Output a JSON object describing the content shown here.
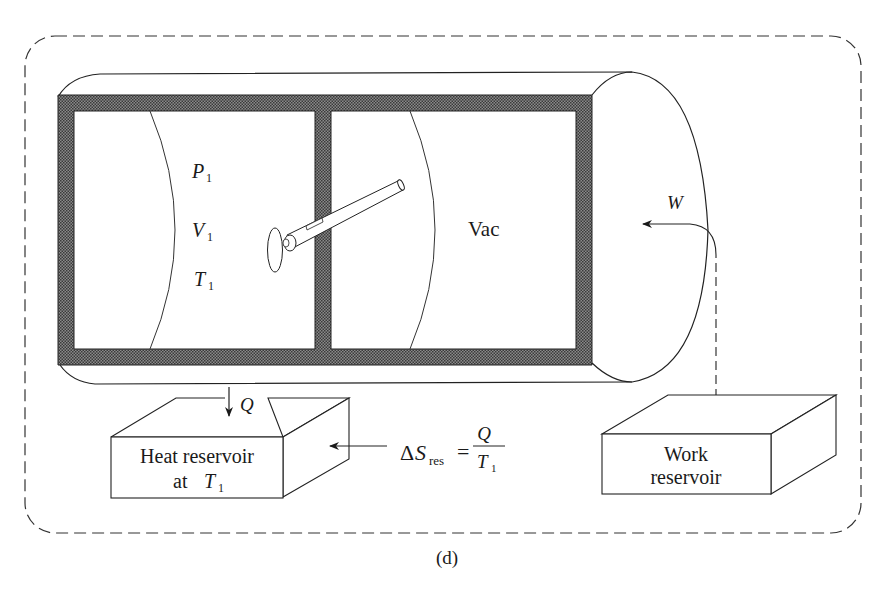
{
  "figure": {
    "caption": "(d)",
    "system_boundary": "dashed-rounded-rectangle"
  },
  "cylinder": {
    "left_chamber": {
      "pressure_label": "P",
      "pressure_sub": "1",
      "volume_label": "V",
      "volume_sub": "1",
      "temperature_label": "T",
      "temperature_sub": "1"
    },
    "right_chamber": {
      "label": "Vac"
    },
    "wall_fill": "#6f6f6f"
  },
  "work": {
    "label": "W"
  },
  "heat": {
    "label": "Q"
  },
  "heat_reservoir": {
    "line1": "Heat reservoir",
    "line2_prefix": "at ",
    "line2_var": "T",
    "line2_sub": "1"
  },
  "work_reservoir": {
    "line1": "Work",
    "line2": "reservoir"
  },
  "entropy_equation": {
    "delta": "Δ",
    "var": "S",
    "sub": "res",
    "equals": "=",
    "numerator": "Q",
    "denominator_var": "T",
    "denominator_sub": "1"
  }
}
